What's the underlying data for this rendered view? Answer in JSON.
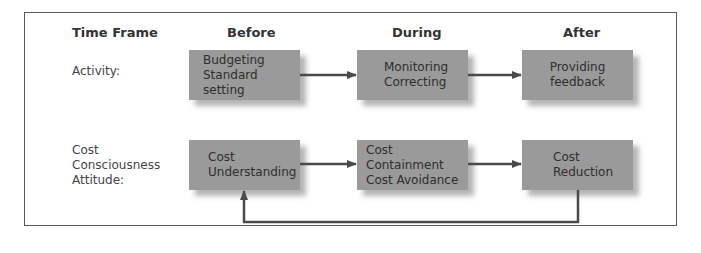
{
  "headers": {
    "time_frame": "Time Frame",
    "before": "Before",
    "during": "During",
    "after": "After"
  },
  "rows": [
    {
      "label_lines": [
        "Activity:"
      ],
      "boxes": [
        {
          "lines": [
            "Budgeting",
            "Standard setting"
          ]
        },
        {
          "lines": [
            "Monitoring",
            "Correcting"
          ]
        },
        {
          "lines": [
            "Providing",
            "feedback"
          ]
        }
      ]
    },
    {
      "label_lines": [
        "Cost",
        "Consciousness",
        "Attitude:"
      ],
      "boxes": [
        {
          "lines": [
            "Cost",
            "Understanding"
          ]
        },
        {
          "lines": [
            "Cost Containment",
            "Cost Avoidance"
          ]
        },
        {
          "lines": [
            "Cost",
            "Reduction"
          ]
        }
      ]
    }
  ],
  "colors": {
    "box_fill": "#9a9a9a",
    "arrow": "#4a4a4a",
    "frame": "#5a5a5a"
  },
  "connections": [
    {
      "from": "Budgeting / Standard setting",
      "to": "Monitoring / Correcting"
    },
    {
      "from": "Monitoring / Correcting",
      "to": "Providing feedback"
    },
    {
      "from": "Cost Understanding",
      "to": "Cost Containment / Cost Avoidance"
    },
    {
      "from": "Cost Containment / Cost Avoidance",
      "to": "Cost Reduction"
    },
    {
      "from": "Cost Reduction",
      "to": "Cost Understanding",
      "type": "feedback-loop"
    }
  ]
}
